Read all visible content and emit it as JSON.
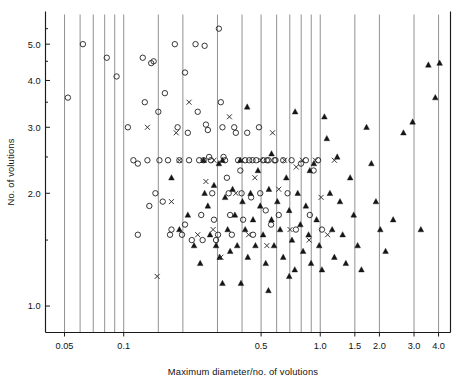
{
  "figure": {
    "background": "#ffffff",
    "ink_color": "#111111",
    "grid_color": "#6e6e6e"
  },
  "chart_data": {
    "type": "scatter",
    "title": "",
    "xlabel": "Maximum diameter/no. of volutions",
    "ylabel": "No. of volutions",
    "xscale": "log",
    "yscale": "log",
    "xlim": [
      0.04,
      4.6
    ],
    "ylim": [
      0.85,
      6.0
    ],
    "grid": "vertical-only",
    "legend": "none",
    "xticks": [
      0.05,
      0.1,
      0.5,
      1.0,
      1.5,
      2.0,
      3.0,
      4.0
    ],
    "xticklabels": [
      "0.05",
      "0.1",
      "0.5",
      "1.0",
      "1.5",
      "2.0",
      "3.0",
      "4.0"
    ],
    "xgridlines": [
      0.05,
      0.06,
      0.07,
      0.08,
      0.09,
      0.1,
      0.15,
      0.2,
      0.3,
      0.4,
      0.5,
      0.6,
      0.7,
      0.8,
      0.9,
      1.0,
      1.5,
      2.0,
      3.0,
      4.0
    ],
    "yticks": [
      1.0,
      2.0,
      3.0,
      4.0,
      5.0
    ],
    "yticklabels": [
      "1.0",
      "2.0",
      "3.0",
      "4.0",
      "5.0"
    ],
    "yminorticks": [
      1.5,
      2.5,
      3.5,
      4.5,
      5.5
    ],
    "series": [
      {
        "name": "open-circle",
        "marker": "circle-open",
        "color": "#2b2b2b",
        "points": [
          [
            0.052,
            3.6
          ],
          [
            0.062,
            5.0
          ],
          [
            0.082,
            4.6
          ],
          [
            0.092,
            4.1
          ],
          [
            0.105,
            3.0
          ],
          [
            0.112,
            2.45
          ],
          [
            0.118,
            2.4
          ],
          [
            0.125,
            4.6
          ],
          [
            0.128,
            3.5
          ],
          [
            0.132,
            2.45
          ],
          [
            0.138,
            4.45
          ],
          [
            0.142,
            4.5
          ],
          [
            0.145,
            2.0
          ],
          [
            0.15,
            3.3
          ],
          [
            0.152,
            2.45
          ],
          [
            0.158,
            1.9
          ],
          [
            0.162,
            3.7
          ],
          [
            0.168,
            2.45
          ],
          [
            0.172,
            1.55
          ],
          [
            0.175,
            1.6
          ],
          [
            0.182,
            5.0
          ],
          [
            0.188,
            3.0
          ],
          [
            0.192,
            2.45
          ],
          [
            0.198,
            1.55
          ],
          [
            0.205,
            4.2
          ],
          [
            0.212,
            2.9
          ],
          [
            0.215,
            2.45
          ],
          [
            0.222,
            1.5
          ],
          [
            0.232,
            5.0
          ],
          [
            0.238,
            3.3
          ],
          [
            0.242,
            2.45
          ],
          [
            0.248,
            1.75
          ],
          [
            0.252,
            1.5
          ],
          [
            0.262,
            3.05
          ],
          [
            0.268,
            2.95
          ],
          [
            0.272,
            2.5
          ],
          [
            0.278,
            2.45
          ],
          [
            0.282,
            2.0
          ],
          [
            0.288,
            1.7
          ],
          [
            0.295,
            1.5
          ],
          [
            0.305,
            5.5
          ],
          [
            0.312,
            3.5
          ],
          [
            0.318,
            3.0
          ],
          [
            0.322,
            2.5
          ],
          [
            0.328,
            2.45
          ],
          [
            0.335,
            2.2
          ],
          [
            0.342,
            2.0
          ],
          [
            0.348,
            1.75
          ],
          [
            0.355,
            1.55
          ],
          [
            0.365,
            3.0
          ],
          [
            0.372,
            2.9
          ],
          [
            0.382,
            2.45
          ],
          [
            0.392,
            2.3
          ],
          [
            0.398,
            2.0
          ],
          [
            0.405,
            1.7
          ],
          [
            0.415,
            2.45
          ],
          [
            0.425,
            2.9
          ],
          [
            0.435,
            2.45
          ],
          [
            0.445,
            1.95
          ],
          [
            0.455,
            1.55
          ],
          [
            0.472,
            2.45
          ],
          [
            0.488,
            3.0
          ],
          [
            0.495,
            2.0
          ],
          [
            0.512,
            2.45
          ],
          [
            0.528,
            1.8
          ],
          [
            0.545,
            2.45
          ],
          [
            0.562,
            1.65
          ],
          [
            0.585,
            2.45
          ],
          [
            0.615,
            1.75
          ],
          [
            0.648,
            2.45
          ],
          [
            0.682,
            2.0
          ],
          [
            0.715,
            2.45
          ],
          [
            0.752,
            1.6
          ],
          [
            0.798,
            2.4
          ],
          [
            0.845,
            2.45
          ],
          [
            0.885,
            1.75
          ],
          [
            0.925,
            2.3
          ],
          [
            0.975,
            2.45
          ],
          [
            1.02,
            1.6
          ],
          [
            0.118,
            1.55
          ],
          [
            0.135,
            1.85
          ],
          [
            0.205,
            1.65
          ],
          [
            0.255,
            2.45
          ],
          [
            0.302,
            1.55
          ],
          [
            0.452,
            2.45
          ],
          [
            0.535,
            2.45
          ],
          [
            0.592,
            2.45
          ],
          [
            0.258,
            4.95
          ]
        ]
      },
      {
        "name": "filled-triangle",
        "marker": "triangle-filled",
        "color": "#151515",
        "points": [
          [
            0.175,
            2.2
          ],
          [
            0.192,
            1.6
          ],
          [
            0.212,
            1.75
          ],
          [
            0.228,
            1.45
          ],
          [
            0.245,
            1.3
          ],
          [
            0.255,
            2.45
          ],
          [
            0.268,
            1.85
          ],
          [
            0.275,
            1.55
          ],
          [
            0.288,
            2.1
          ],
          [
            0.295,
            1.45
          ],
          [
            0.308,
            1.35
          ],
          [
            0.318,
            2.45
          ],
          [
            0.328,
            1.95
          ],
          [
            0.338,
            1.6
          ],
          [
            0.348,
            1.4
          ],
          [
            0.358,
            2.05
          ],
          [
            0.368,
            1.75
          ],
          [
            0.378,
            1.45
          ],
          [
            0.392,
            2.45
          ],
          [
            0.402,
            1.9
          ],
          [
            0.415,
            1.6
          ],
          [
            0.428,
            1.35
          ],
          [
            0.442,
            2.0
          ],
          [
            0.455,
            1.7
          ],
          [
            0.468,
            1.45
          ],
          [
            0.482,
            2.3
          ],
          [
            0.495,
            1.85
          ],
          [
            0.512,
            1.55
          ],
          [
            0.528,
            1.3
          ],
          [
            0.548,
            2.05
          ],
          [
            0.565,
            1.7
          ],
          [
            0.582,
            1.45
          ],
          [
            0.605,
            1.9
          ],
          [
            0.625,
            1.6
          ],
          [
            0.648,
            1.35
          ],
          [
            0.672,
            2.2
          ],
          [
            0.695,
            1.8
          ],
          [
            0.718,
            1.5
          ],
          [
            0.742,
            1.25
          ],
          [
            0.768,
            2.0
          ],
          [
            0.792,
            1.65
          ],
          [
            0.818,
            1.4
          ],
          [
            0.845,
            1.85
          ],
          [
            0.872,
            1.55
          ],
          [
            0.898,
            1.3
          ],
          [
            0.928,
            2.4
          ],
          [
            0.958,
            1.7
          ],
          [
            0.988,
            1.45
          ],
          [
            1.02,
            1.25
          ],
          [
            1.05,
            3.2
          ],
          [
            1.08,
            2.8
          ],
          [
            1.12,
            2.0
          ],
          [
            1.15,
            1.6
          ],
          [
            1.18,
            1.35
          ],
          [
            1.22,
            2.5
          ],
          [
            1.26,
            1.9
          ],
          [
            1.3,
            1.55
          ],
          [
            1.35,
            1.3
          ],
          [
            1.42,
            2.2
          ],
          [
            1.48,
            1.75
          ],
          [
            1.55,
            1.45
          ],
          [
            1.62,
            1.25
          ],
          [
            1.72,
            3.0
          ],
          [
            1.82,
            2.4
          ],
          [
            1.92,
            1.9
          ],
          [
            2.02,
            1.6
          ],
          [
            2.15,
            1.4
          ],
          [
            2.35,
            1.7
          ],
          [
            2.65,
            2.9
          ],
          [
            2.95,
            3.1
          ],
          [
            3.25,
            1.6
          ],
          [
            3.55,
            4.4
          ],
          [
            3.85,
            3.6
          ],
          [
            4.05,
            4.45
          ],
          [
            0.425,
            3.4
          ],
          [
            0.745,
            3.3
          ],
          [
            0.565,
            2.55
          ],
          [
            0.885,
            2.3
          ],
          [
            0.318,
            1.15
          ],
          [
            0.395,
            1.15
          ],
          [
            0.545,
            1.1
          ],
          [
            0.695,
            1.2
          ],
          [
            0.258,
            2.0
          ],
          [
            0.305,
            2.4
          ]
        ]
      },
      {
        "name": "cross",
        "marker": "x",
        "color": "#2b2b2b",
        "points": [
          [
            0.132,
            3.0
          ],
          [
            0.148,
            1.2
          ],
          [
            0.175,
            1.9
          ],
          [
            0.192,
            2.45
          ],
          [
            0.215,
            3.5
          ],
          [
            0.238,
            1.55
          ],
          [
            0.262,
            2.15
          ],
          [
            0.288,
            2.45
          ],
          [
            0.312,
            1.35
          ],
          [
            0.345,
            3.2
          ],
          [
            0.372,
            2.0
          ],
          [
            0.398,
            2.45
          ],
          [
            0.432,
            1.55
          ],
          [
            0.465,
            2.2
          ],
          [
            0.498,
            2.45
          ],
          [
            0.535,
            1.45
          ],
          [
            0.572,
            2.9
          ],
          [
            0.615,
            2.05
          ],
          [
            0.658,
            2.45
          ],
          [
            0.702,
            1.6
          ],
          [
            0.755,
            2.35
          ],
          [
            0.812,
            2.45
          ],
          [
            0.878,
            1.5
          ],
          [
            0.945,
            2.45
          ],
          [
            1.01,
            1.95
          ],
          [
            1.09,
            1.55
          ],
          [
            1.18,
            2.45
          ],
          [
            0.285,
            1.6
          ],
          [
            0.185,
            2.9
          ],
          [
            0.255,
            2.45
          ]
        ]
      }
    ]
  }
}
